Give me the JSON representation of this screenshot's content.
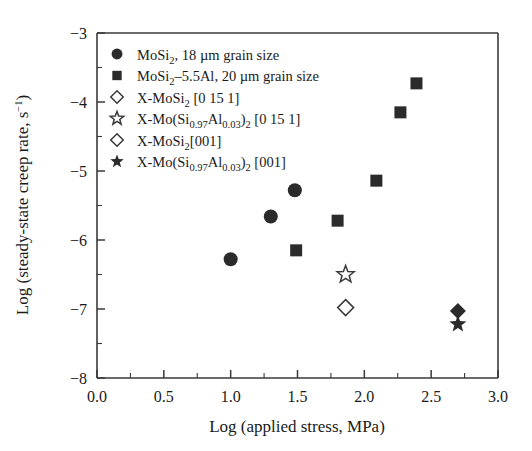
{
  "figure": {
    "background_color": "#ffffff",
    "marker_color": "#2b2b2b",
    "axis_color": "#3a3a3a"
  },
  "chart_data": {
    "type": "scatter",
    "title": "",
    "xlabel": "Log (applied stress, MPa)",
    "ylabel": "Log (steady-state creep rate, s",
    "ylabel_sup": "−1",
    "ylabel_close": ")",
    "xlim": [
      0.0,
      3.0
    ],
    "ylim": [
      -8,
      -3
    ],
    "xticks": [
      0.0,
      0.5,
      1.0,
      1.5,
      2.0,
      2.5,
      3.0
    ],
    "xtick_labels": [
      "0.0",
      "0.5",
      "1.0",
      "1.5",
      "2.0",
      "2.5",
      "3.0"
    ],
    "xminor_step": 0.25,
    "yticks": [
      -3,
      -4,
      -5,
      -6,
      -7,
      -8
    ],
    "ytick_labels": [
      "−3",
      "−4",
      "−5",
      "−6",
      "−7",
      "−8"
    ],
    "yminor_step": 0.5,
    "grid": false,
    "legend_position": "upper-left-inside",
    "series": [
      {
        "name": "MoSi2, 18 um grain size",
        "marker": "circle-filled",
        "points": [
          {
            "x": 1.0,
            "y": -6.28
          },
          {
            "x": 1.3,
            "y": -5.66
          },
          {
            "x": 1.48,
            "y": -5.28
          }
        ]
      },
      {
        "name": "MoSi2-5.5Al, 20 um grain size",
        "marker": "square-filled",
        "points": [
          {
            "x": 1.49,
            "y": -6.15
          },
          {
            "x": 1.8,
            "y": -5.72
          },
          {
            "x": 2.09,
            "y": -5.14
          },
          {
            "x": 2.27,
            "y": -4.15
          },
          {
            "x": 2.39,
            "y": -3.73
          }
        ]
      },
      {
        "name": "X-MoSi2 [0 15 1]",
        "marker": "diamond-open",
        "points": [
          {
            "x": 1.86,
            "y": -6.98
          }
        ]
      },
      {
        "name": "X-Mo(Si0.97Al0.03)2 [0 15 1]",
        "marker": "star-open",
        "points": [
          {
            "x": 1.86,
            "y": -6.5
          }
        ]
      },
      {
        "name": "X-MoSi2[001]",
        "marker": "diamond-filled",
        "points": [
          {
            "x": 2.7,
            "y": -7.03
          }
        ]
      },
      {
        "name": "X-Mo(Si0.97Al0.03)2 [001]",
        "marker": "star-filled",
        "points": [
          {
            "x": 2.7,
            "y": -7.22
          }
        ]
      }
    ]
  },
  "legend": {
    "entries": [
      {
        "marker": "circle-filled",
        "parts": [
          {
            "t": "MoSi",
            "k": "n"
          },
          {
            "t": "2",
            "k": "sub"
          },
          {
            "t": ", 18 µm grain size",
            "k": "n"
          }
        ]
      },
      {
        "marker": "square-filled",
        "parts": [
          {
            "t": "MoSi",
            "k": "n"
          },
          {
            "t": "2",
            "k": "sub"
          },
          {
            "t": "–5.5Al, 20 µm grain size",
            "k": "n"
          }
        ]
      },
      {
        "marker": "diamond-open",
        "parts": [
          {
            "t": "X-MoSi",
            "k": "n"
          },
          {
            "t": "2",
            "k": "sub"
          },
          {
            "t": " [0 15 1]",
            "k": "n"
          }
        ]
      },
      {
        "marker": "star-open",
        "parts": [
          {
            "t": "X-Mo(Si",
            "k": "n"
          },
          {
            "t": "0.97",
            "k": "sub"
          },
          {
            "t": "Al",
            "k": "n"
          },
          {
            "t": "0.03",
            "k": "sub"
          },
          {
            "t": ")",
            "k": "n"
          },
          {
            "t": "2",
            "k": "sub"
          },
          {
            "t": " [0 15 1]",
            "k": "n"
          }
        ]
      },
      {
        "marker": "diamond-open",
        "parts": [
          {
            "t": "X-MoSi",
            "k": "n"
          },
          {
            "t": "2",
            "k": "sub"
          },
          {
            "t": "[001]",
            "k": "n"
          }
        ]
      },
      {
        "marker": "star-filled",
        "parts": [
          {
            "t": "X-Mo(Si",
            "k": "n"
          },
          {
            "t": "0.97",
            "k": "sub"
          },
          {
            "t": "Al",
            "k": "n"
          },
          {
            "t": "0.03",
            "k": "sub"
          },
          {
            "t": ")",
            "k": "n"
          },
          {
            "t": "2",
            "k": "sub"
          },
          {
            "t": " [001]",
            "k": "n"
          }
        ]
      }
    ]
  }
}
